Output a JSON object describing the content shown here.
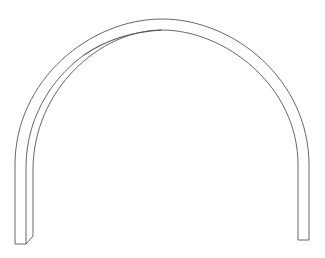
{
  "diagram": {
    "colors": {
      "stroke": "#555555",
      "background": "#ffffff"
    }
  }
}
